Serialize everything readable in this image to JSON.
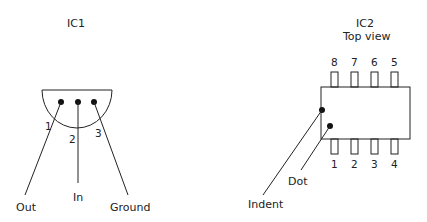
{
  "ic1": {
    "title": "IC1",
    "pins": [
      {
        "number": "1",
        "name": "Out"
      },
      {
        "number": "2",
        "name": "In"
      },
      {
        "number": "3",
        "name": "Ground"
      }
    ]
  },
  "ic2": {
    "title": "IC2",
    "subtitle": "Top view",
    "top_pins": [
      "8",
      "7",
      "6",
      "5"
    ],
    "bottom_pins": [
      "1",
      "2",
      "3",
      "4"
    ],
    "callouts": {
      "indent": "Indent",
      "dot": "Dot"
    }
  }
}
